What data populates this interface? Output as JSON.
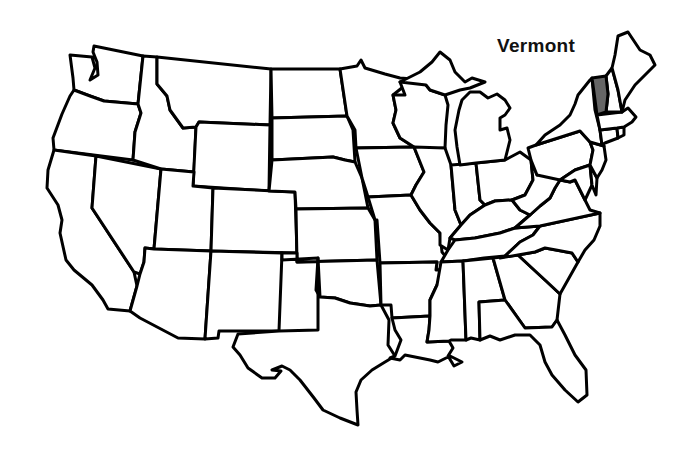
{
  "map": {
    "title": "Vermont",
    "highlight_color": "#666666",
    "fill_color": "#ffffff",
    "stroke_color": "#000000",
    "label": {
      "text": "Vermont",
      "x": 497,
      "y": 35
    },
    "highlighted_state": "Vermont",
    "states": [
      {
        "id": "WA",
        "name": "Washington",
        "d": "M70,55 L92,57 L95,68 L90,80 L98,75 L97,62 L93,52 L94,46 L143,56 L138,104 L104,101 L90,96 L74,90 L73,78 Z"
      },
      {
        "id": "OR",
        "name": "Oregon",
        "d": "M74,90 L90,96 L104,101 L138,104 L141,113 L135,132 L133,160 L54,150 L53,138 L62,114 L70,96 Z"
      },
      {
        "id": "CA",
        "name": "California",
        "d": "M54,150 L96,156 L92,208 L134,272 L137,286 L130,311 L108,309 L103,300 L92,285 L74,270 L66,260 L60,233 L62,220 L58,205 L47,188 L48,170 Z"
      },
      {
        "id": "NV",
        "name": "Nevada",
        "d": "M96,156 L161,169 L154,249 L145,248 L144,262 L140,274 L134,272 L92,208 Z"
      },
      {
        "id": "ID",
        "name": "Idaho",
        "d": "M143,56 L157,57 L157,84 L167,96 L170,110 L183,128 L196,127 L194,172 L161,169 L133,160 L135,132 L141,113 L138,104 Z"
      },
      {
        "id": "MT",
        "name": "Montana",
        "d": "M157,57 L271,69 L270,125 L199,122 L196,127 L183,128 L170,110 L167,96 L157,84 Z"
      },
      {
        "id": "WY",
        "name": "Wyoming",
        "d": "M199,122 L270,125 L269,191 L193,186 L196,127 Z"
      },
      {
        "id": "UT",
        "name": "Utah",
        "d": "M161,169 L194,172 L193,186 L213,188 L211,251 L154,249 Z"
      },
      {
        "id": "CO",
        "name": "Colorado",
        "d": "M213,188 L295,192 L297,253 L211,251 Z"
      },
      {
        "id": "AZ",
        "name": "Arizona",
        "d": "M154,249 L211,251 L205,339 L178,338 L140,318 L130,311 L137,286 L140,274 L144,262 L145,248 Z"
      },
      {
        "id": "NM",
        "name": "New Mexico",
        "d": "M211,251 L282,253 L279,331 L219,331 L218,338 L205,339 Z"
      },
      {
        "id": "ND",
        "name": "North Dakota",
        "d": "M271,69 L340,69 L347,116 L272,118 Z"
      },
      {
        "id": "SD",
        "name": "South Dakota",
        "d": "M272,118 L347,116 L353,130 L355,162 L345,160 L333,157 L272,160 Z"
      },
      {
        "id": "NE",
        "name": "Nebraska",
        "d": "M272,160 L333,157 L345,160 L355,162 L362,178 L368,208 L296,209 L295,192 L269,191 Z"
      },
      {
        "id": "KS",
        "name": "Kansas",
        "d": "M296,209 L368,208 L375,220 L377,260 L297,262 Z"
      },
      {
        "id": "OK",
        "name": "Oklahoma",
        "d": "M282,253 L297,253 L297,262 L377,260 L381,305 L370,306 L350,303 L335,298 L320,297 L316,290 L318,258 L282,260 Z"
      },
      {
        "id": "TX",
        "name": "Texas",
        "d": "M279,331 L318,330 L318,258 L320,297 L335,298 L350,303 L370,306 L381,305 L389,320 L388,345 L395,356 L385,362 L372,370 L361,380 L356,392 L357,410 L358,425 L340,418 L323,410 L314,398 L300,380 L290,370 L282,366 L272,370 L281,371 L275,378 L262,378 L248,368 L240,355 L233,347 L238,334 Z"
      },
      {
        "id": "MN",
        "name": "Minnesota",
        "d": "M340,69 L357,66 L361,60 L365,68 L385,74 L400,78 L413,79 L393,95 L396,110 L393,123 L400,138 L414,147 L356,148 L355,130 L347,116 Z"
      },
      {
        "id": "IA",
        "name": "Iowa",
        "d": "M356,148 L414,147 L420,162 L424,172 L416,185 L411,195 L368,197 L362,178 Z"
      },
      {
        "id": "MO",
        "name": "Missouri",
        "d": "M368,197 L411,195 L420,210 L430,223 L440,233 L442,252 L450,262 L444,270 L436,270 L437,262 L380,263 L377,220 L375,220 Z"
      },
      {
        "id": "AR",
        "name": "Arkansas",
        "d": "M380,263 L437,262 L436,270 L444,270 L437,285 L430,300 L430,316 L392,318 L391,305 L381,305 Z"
      },
      {
        "id": "LA",
        "name": "Louisiana",
        "d": "M392,318 L430,316 L429,330 L427,342 L449,341 L453,348 L448,356 L454,366 L462,362 L450,356 L438,362 L430,360 L420,358 L405,355 L400,360 L390,358 L395,356 L401,340 L395,330 Z"
      },
      {
        "id": "WI",
        "name": "Wisconsin",
        "d": "M413,79 L400,82 L405,95 L393,95 L396,110 L393,123 L400,138 L414,147 L420,150 L445,148 L446,125 L448,105 L445,95 L430,90 L426,85 Z"
      },
      {
        "id": "IL",
        "name": "Illinois",
        "d": "M414,147 L445,148 L451,165 L455,210 L461,225 L450,238 L448,250 L440,245 L440,233 L430,223 L420,210 L411,195 L416,185 L424,172 L420,162 Z"
      },
      {
        "id": "IN",
        "name": "Indiana",
        "d": "M451,165 L476,163 L480,200 L485,205 L470,215 L461,225 L455,210 Z"
      },
      {
        "id": "OH",
        "name": "Ohio",
        "d": "M476,163 L505,160 L520,152 L531,160 L533,180 L525,195 L512,200 L495,201 L485,205 L480,200 Z"
      },
      {
        "id": "MI",
        "name": "Michigan",
        "d": "M457,147 L455,130 L459,110 L462,100 L470,92 L480,92 L488,98 L497,94 L505,100 L510,108 L505,115 L500,118 L500,130 L507,128 L510,140 L505,160 L476,163 L460,165 Z M400,82 L420,72 L432,62 L440,52 L450,60 L455,72 L465,82 L472,78 L485,82 L470,88 L460,90 L445,95 L430,90 L426,85 Z"
      },
      {
        "id": "KY",
        "name": "Kentucky",
        "d": "M450,238 L461,225 L470,215 L485,205 L495,201 L512,200 L520,210 L530,215 L515,228 L500,233 L475,238 L455,240 Z"
      },
      {
        "id": "TN",
        "name": "Tennessee",
        "d": "M448,250 L455,240 L475,238 L500,233 L515,228 L540,226 L533,235 L520,242 L505,256 L484,258 L463,261 L441,262 Z"
      },
      {
        "id": "MS",
        "name": "Mississippi",
        "d": "M441,262 L463,261 L466,340 L451,340 L449,341 L427,342 L429,330 L430,316 L430,300 L437,285 Z"
      },
      {
        "id": "AL",
        "name": "Alabama",
        "d": "M463,261 L493,258 L505,300 L479,302 L480,340 L471,338 L466,340 Z"
      },
      {
        "id": "GA",
        "name": "Georgia",
        "d": "M493,258 L518,255 L532,268 L545,280 L560,294 L557,320 L552,327 L525,328 L505,300 Z"
      },
      {
        "id": "FL",
        "name": "Florida",
        "d": "M479,302 L505,300 L525,328 L552,327 L557,320 L565,335 L575,355 L586,370 L587,395 L578,402 L565,390 L552,375 L545,362 L540,345 L530,335 L515,335 L500,340 L490,336 L480,340 Z"
      },
      {
        "id": "SC",
        "name": "South Carolina",
        "d": "M518,255 L535,252 L545,248 L556,250 L572,253 L578,262 L560,294 L545,280 L532,268 Z"
      },
      {
        "id": "NC",
        "name": "North Carolina",
        "d": "M505,256 L520,242 L533,235 L540,226 L600,213 L600,226 L594,240 L585,250 L578,262 L572,253 L556,250 L545,248 L535,252 L518,255 L500,258 Z"
      },
      {
        "id": "VA",
        "name": "Virginia",
        "d": "M530,215 L540,206 L550,198 L555,188 L560,180 L570,182 L575,180 L580,190 L585,200 L590,210 L600,213 L540,226 L515,228 Z"
      },
      {
        "id": "WV",
        "name": "West Virginia",
        "d": "M525,195 L533,180 L531,160 L537,175 L546,170 L555,165 L560,180 L555,188 L550,198 L540,206 L530,215 L520,210 L512,200 Z"
      },
      {
        "id": "PA",
        "name": "Pennsylvania",
        "d": "M531,160 L528,148 L536,145 L580,131 L590,142 L593,150 L590,165 L575,170 L560,180 L537,175 Z"
      },
      {
        "id": "MD",
        "name": "Maryland",
        "d": "M560,180 L575,170 L590,165 L592,185 L585,200 L580,190 L575,180 L570,182 Z"
      },
      {
        "id": "DE",
        "name": "Delaware",
        "d": "M590,165 L597,178 L596,195 L592,185 Z"
      },
      {
        "id": "NJ",
        "name": "New Jersey",
        "d": "M590,142 L604,146 L606,160 L602,170 L597,178 L590,165 L593,150 Z"
      },
      {
        "id": "NY",
        "name": "New York",
        "d": "M536,145 L545,135 L560,125 L570,115 L575,104 L578,95 L590,80 L592,78 L595,110 L600,130 L602,145 L604,146 L590,142 L580,131 Z"
      },
      {
        "id": "CT",
        "name": "Connecticut",
        "d": "M600,130 L617,128 L618,138 L605,143 L602,145 Z"
      },
      {
        "id": "RI",
        "name": "Rhode Island",
        "d": "M617,128 L624,127 L624,135 L618,138 Z"
      },
      {
        "id": "MA",
        "name": "Massachusetts",
        "d": "M597,115 L622,112 L628,108 L636,117 L632,122 L624,127 L617,128 L600,130 Z"
      },
      {
        "id": "VT",
        "name": "Vermont",
        "d": "M592,78 L606,76 L608,94 L606,112 L597,115 L595,100 Z"
      },
      {
        "id": "NH",
        "name": "New Hampshire",
        "d": "M606,76 L612,68 L618,90 L622,112 L606,112 L608,94 Z"
      },
      {
        "id": "ME",
        "name": "Maine",
        "d": "M612,68 L615,55 L618,36 L628,32 L640,50 L650,55 L655,65 L645,75 L635,85 L625,100 L622,112 L618,90 Z"
      }
    ]
  }
}
